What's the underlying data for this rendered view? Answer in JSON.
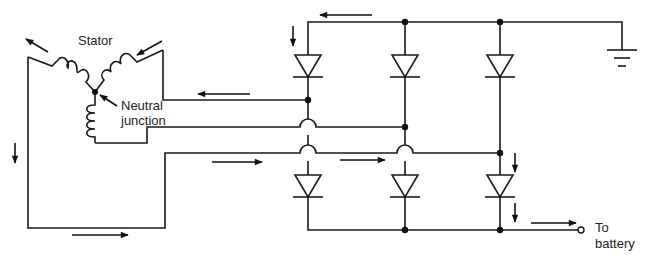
{
  "diagram": {
    "labels": {
      "stator": "Stator",
      "neutral_line1": "Neutral",
      "neutral_line2": "junction",
      "output_line1": "To",
      "output_line2": "battery"
    },
    "components": {
      "stator_windings": 3,
      "positive_diodes": 3,
      "negative_diodes": 3,
      "ground_symbol": "ground-icon",
      "output_terminal": "terminal-icon"
    },
    "colors": {
      "line": "#1a1a1a",
      "background": "#ffffff",
      "text": "#222222"
    }
  }
}
